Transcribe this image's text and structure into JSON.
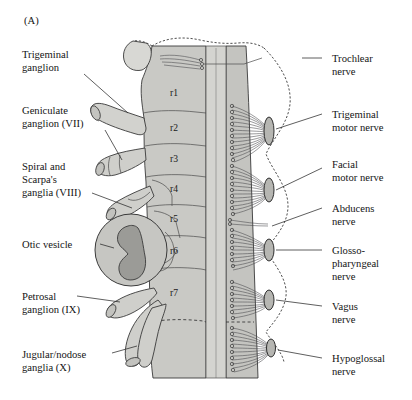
{
  "figure": {
    "panel_label": "(A)",
    "background_color": "#ffffff",
    "tissue_fill": "#c9c9c5",
    "tissue_fill_light": "#d6d6d2",
    "neural_tube_fill": "#c2c2be",
    "floorplate_fill": "#d2d2ce",
    "otic_outer_fill": "#c6c6c2",
    "otic_lumen_fill": "#9b9b97",
    "nerve_root_fill": "#b6b6b2",
    "outline_color": "#3a3a3a",
    "text_color": "#141414"
  },
  "labels_left": [
    {
      "id": "trigeminal-ganglion",
      "lines": [
        "Trigeminal",
        "ganglion"
      ],
      "x": 22,
      "y": 58
    },
    {
      "id": "geniculate-ganglion",
      "lines": [
        "Geniculate",
        "ganglion (VII)"
      ],
      "x": 22,
      "y": 114
    },
    {
      "id": "spiral-scarpas-ganglia",
      "lines": [
        "Spiral and",
        "Scarpa's",
        "ganglia (VIII)"
      ],
      "x": 22,
      "y": 170
    },
    {
      "id": "otic-vesicle",
      "lines": [
        "Otic vesicle"
      ],
      "x": 22,
      "y": 244
    },
    {
      "id": "petrosal-ganglion",
      "lines": [
        "Petrosal",
        "ganglion (IX)"
      ],
      "x": 22,
      "y": 296
    },
    {
      "id": "jugular-nodose-ganglia",
      "lines": [
        "Jugular/nodose",
        "ganglia (X)"
      ],
      "x": 22,
      "y": 358
    }
  ],
  "labels_right": [
    {
      "id": "trochlear-nerve",
      "lines": [
        "Trochlear",
        "nerve"
      ],
      "x": 332,
      "y": 58
    },
    {
      "id": "trigeminal-motor-nerve",
      "lines": [
        "Trigeminal",
        "motor  nerve"
      ],
      "x": 332,
      "y": 114
    },
    {
      "id": "facial-motor-nerve",
      "lines": [
        "Facial",
        "motor nerve"
      ],
      "x": 332,
      "y": 162
    },
    {
      "id": "abducens-nerve",
      "lines": [
        "Abducens",
        "nerve"
      ],
      "x": 332,
      "y": 208
    },
    {
      "id": "glossopharyngeal-nerve",
      "lines": [
        "Glosso-",
        "pharyngeal",
        "nerve"
      ],
      "x": 332,
      "y": 250
    },
    {
      "id": "vagus-nerve",
      "lines": [
        "Vagus",
        "nerve"
      ],
      "x": 332,
      "y": 306
    },
    {
      "id": "hypoglossal-nerve",
      "lines": [
        "Hypoglossal",
        "nerve"
      ],
      "x": 332,
      "y": 358
    }
  ],
  "rhombomeres": [
    {
      "id": "r1",
      "label": "r1",
      "x": 170,
      "y": 96
    },
    {
      "id": "r2",
      "label": "r2",
      "x": 170,
      "y": 131
    },
    {
      "id": "r3",
      "label": "r3",
      "x": 170,
      "y": 162
    },
    {
      "id": "r4",
      "label": "r4",
      "x": 170,
      "y": 192
    },
    {
      "id": "r5",
      "label": "r5",
      "x": 170,
      "y": 222
    },
    {
      "id": "r6",
      "label": "r6",
      "x": 170,
      "y": 254
    },
    {
      "id": "r7",
      "label": "r7",
      "x": 170,
      "y": 296
    }
  ],
  "nerve_roots": [
    {
      "id": "trochlear-root",
      "nerve": "Trochlear",
      "cx": 206,
      "cy": 62
    },
    {
      "id": "trigeminal-motor-root",
      "nerve": "Trigeminal motor",
      "cx": 268,
      "cy": 131
    },
    {
      "id": "facial-motor-root",
      "nerve": "Facial motor",
      "cx": 268,
      "cy": 190
    },
    {
      "id": "glossopharyngeal-root",
      "nerve": "Glossopharyngeal",
      "cx": 268,
      "cy": 250
    },
    {
      "id": "vagus-root",
      "nerve": "Vagus",
      "cx": 268,
      "cy": 300
    },
    {
      "id": "hypoglossal-root",
      "nerve": "Hypoglossal",
      "cx": 268,
      "cy": 345
    }
  ],
  "ganglia": [
    {
      "id": "trigeminal-ganglion-shape",
      "name": "Trigeminal ganglion"
    },
    {
      "id": "geniculate-ganglion-shape",
      "name": "Geniculate ganglion (VII)"
    },
    {
      "id": "spiral-scarpa-ganglion-shape",
      "name": "Spiral and Scarpa's ganglia (VIII)"
    },
    {
      "id": "petrosal-ganglion-shape",
      "name": "Petrosal ganglion (IX)"
    },
    {
      "id": "jugular-nodose-ganglion-shape",
      "name": "Jugular/nodose ganglia (X)"
    }
  ],
  "otic_vesicle": {
    "id": "otic-vesicle-shape",
    "name": "Otic vesicle",
    "cx": 131,
    "cy": 250,
    "r": 36
  }
}
